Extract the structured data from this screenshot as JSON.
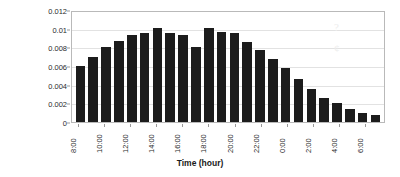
{
  "chart_data": {
    "type": "bar",
    "title": "",
    "subtitle": "",
    "xlabel": "Time (hour)",
    "ylabel": "User Association Rate",
    "categories": [
      "8:00",
      "9:00",
      "10:00",
      "11:00",
      "12:00",
      "13:00",
      "14:00",
      "15:00",
      "16:00",
      "17:00",
      "18:00",
      "19:00",
      "20:00",
      "21:00",
      "22:00",
      "23:00",
      "0:00",
      "1:00",
      "2:00",
      "3:00",
      "4:00",
      "5:00",
      "6:00",
      "7:00"
    ],
    "values": [
      0.006,
      0.007,
      0.008,
      0.0087,
      0.0093,
      0.0095,
      0.0101,
      0.0095,
      0.0093,
      0.008,
      0.0101,
      0.0096,
      0.0095,
      0.0086,
      0.0077,
      0.0068,
      0.0058,
      0.0046,
      0.0035,
      0.0026,
      0.002,
      0.0014,
      0.001,
      0.0007
    ],
    "values_display": [
      0.006,
      0.007,
      0.008,
      0.0087,
      0.0093,
      0.0095,
      0.0101,
      0.0095,
      0.0093,
      0.008,
      0.0101,
      0.0096,
      0.0095,
      0.0086,
      0.0077,
      0.0068,
      0.0058,
      0.0046,
      0.0035,
      0.0026,
      0.002,
      0.0014,
      0.001,
      0.0007
    ],
    "ylim": [
      0,
      0.012
    ],
    "yticks": [
      0,
      0.002,
      0.004,
      0.006,
      0.008,
      0.01,
      0.012
    ],
    "ytick_labels": [
      "0",
      "0.002",
      "0.004",
      "0.006",
      "0.008",
      "0.01",
      "0.012"
    ],
    "xtick_labels": [
      "8:00",
      "10:00",
      "12:00",
      "14:00",
      "16:00",
      "18:00",
      "20:00",
      "22:00",
      "0:00",
      "2:00",
      "4:00",
      "6:00"
    ],
    "xtick_indices": [
      0,
      2,
      4,
      6,
      8,
      10,
      12,
      14,
      16,
      18,
      20,
      22
    ],
    "grid": true,
    "grid_axis": "y",
    "legend": false,
    "legend_position": "none",
    "bar_color": "#1c1c1c",
    "plot_border_color": "#b9b9b9",
    "gridline_color": "#e2e2e2",
    "background_color": "#ffffff",
    "annotations": [
      {
        "name": "scan-smudge",
        "text": "?",
        "x_pct": 84,
        "y_pct": 8
      },
      {
        "name": "scan-smudge",
        "text": "¢",
        "x_pct": 84,
        "y_pct": 27
      }
    ]
  }
}
